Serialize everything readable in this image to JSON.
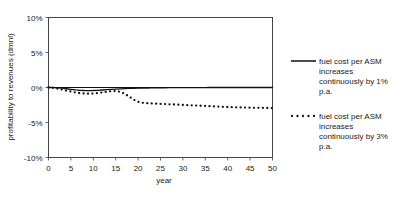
{
  "chart_data": {
    "type": "line",
    "title": "",
    "xlabel": "year",
    "ylabel": "profitability to revenues (dmnl)",
    "xlim": [
      0,
      50
    ],
    "ylim": [
      -0.1,
      0.1
    ],
    "grid": false,
    "legend_position": "right",
    "x_ticks": [
      0,
      5,
      10,
      15,
      20,
      25,
      30,
      35,
      40,
      45,
      50
    ],
    "x_tick_labels": [
      "0",
      "5",
      "10",
      "15",
      "20",
      "25",
      "30",
      "35",
      "40",
      "45",
      "50"
    ],
    "y_ticks": [
      0.1,
      0.05,
      0.0,
      -0.05,
      -0.1
    ],
    "y_tick_labels": [
      "10%",
      "5%",
      "0%",
      "-5%",
      "-10%"
    ],
    "x": [
      0,
      1,
      2,
      3,
      4,
      5,
      6,
      7,
      8,
      9,
      10,
      11,
      12,
      13,
      14,
      15,
      16,
      17,
      18,
      19,
      20,
      21,
      22,
      23,
      24,
      25,
      26,
      27,
      28,
      29,
      30,
      31,
      32,
      33,
      34,
      35,
      36,
      37,
      38,
      39,
      40,
      41,
      42,
      43,
      44,
      45,
      46,
      47,
      48,
      49,
      50
    ],
    "series": [
      {
        "name": "fuel cost per ASM increases continuously by 1% p.a.",
        "style": "solid",
        "color": "#111111",
        "values": [
          0.0,
          0.0,
          -0.0005,
          -0.001,
          -0.0018,
          -0.0026,
          -0.0034,
          -0.004,
          -0.0043,
          -0.0044,
          -0.0043,
          -0.004,
          -0.0036,
          -0.0031,
          -0.0026,
          -0.0022,
          -0.0019,
          -0.0016,
          -0.0013,
          -0.0011,
          -0.0009,
          -0.0008,
          -0.0007,
          -0.0006,
          -0.0005,
          -0.0004,
          -0.0004,
          -0.0003,
          -0.0003,
          -0.0002,
          -0.0002,
          -0.0002,
          -0.0001,
          -0.0001,
          -0.0001,
          -0.0001,
          0.0,
          0.0,
          0.0,
          0.0,
          0.0,
          0.0,
          0.0,
          0.0,
          0.0,
          0.0,
          0.0,
          0.0,
          0.0,
          0.0,
          0.0
        ]
      },
      {
        "name": "fuel cost per ASM increases continuously by 3% p.a.",
        "style": "dotted",
        "color": "#111111",
        "values": [
          0.0,
          -0.0005,
          -0.0016,
          -0.003,
          -0.0045,
          -0.0058,
          -0.007,
          -0.008,
          -0.0086,
          -0.0088,
          -0.0086,
          -0.008,
          -0.0071,
          -0.0061,
          -0.0052,
          -0.005,
          -0.0062,
          -0.009,
          -0.013,
          -0.0175,
          -0.0205,
          -0.0218,
          -0.0224,
          -0.0228,
          -0.0231,
          -0.0234,
          -0.0237,
          -0.024,
          -0.0243,
          -0.0246,
          -0.0249,
          -0.0252,
          -0.0255,
          -0.0258,
          -0.0261,
          -0.0264,
          -0.0267,
          -0.027,
          -0.0273,
          -0.0276,
          -0.0279,
          -0.0281,
          -0.0283,
          -0.0285,
          -0.0287,
          -0.0289,
          -0.029,
          -0.0291,
          -0.0292,
          -0.0293,
          -0.0294
        ]
      }
    ]
  },
  "legend": {
    "entries": [
      {
        "label": "fuel cost per ASM increases continuously by 1% p.a.",
        "style": "solid"
      },
      {
        "label": "fuel cost per ASM increases continuously by 3% p.a.",
        "style": "dotted"
      }
    ]
  }
}
